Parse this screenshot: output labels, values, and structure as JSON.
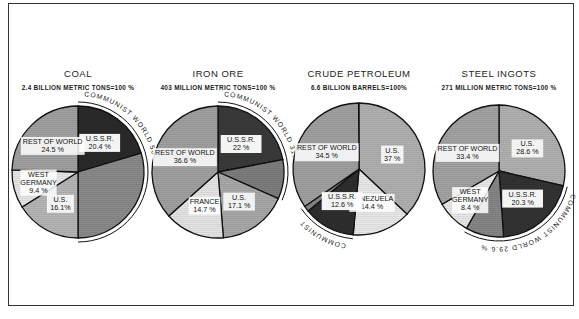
{
  "chart_data": [
    {
      "type": "pie",
      "title": "COAL",
      "subtitle": "2.4 BILLION METRIC TONS=100 %",
      "slices": [
        {
          "label": "U.S.S.R.",
          "value": 20.4,
          "shade": "#2a2a2a",
          "text": "U.S.S.R.|20.4 %"
        },
        {
          "label": "Other Communist",
          "value": 29.6,
          "shade": "#8a8a8a",
          "text": ""
        },
        {
          "label": "U.S.",
          "value": 16.1,
          "shade": "#b5b5b5",
          "text": "U.S.|16.1%"
        },
        {
          "label": "West Germany",
          "value": 9.4,
          "shade": "#e6e6e6",
          "text": "WEST|GERMANY|9.4 %"
        },
        {
          "label": "Rest of World",
          "value": 24.5,
          "shade": "#a0a0a0",
          "text": "REST OF WORLD|24.5 %"
        }
      ],
      "annotation": {
        "text": "COMMUNIST WORLD",
        "value": "50 %"
      }
    },
    {
      "type": "pie",
      "title": "IRON ORE",
      "subtitle": "403 MILLION METRIC TONS=100 %",
      "slices": [
        {
          "label": "U.S.S.R.",
          "value": 22,
          "shade": "#3a3a3a",
          "text": "U.S.S.R.|22 %"
        },
        {
          "label": "Other Communist",
          "value": 9.6,
          "shade": "#7d7d7d",
          "text": ""
        },
        {
          "label": "U.S.",
          "value": 17.1,
          "shade": "#a8a8a8",
          "text": "U.S.|17.1 %"
        },
        {
          "label": "France",
          "value": 14.7,
          "shade": "#e4e4e4",
          "text": "FRANCE|14.7 %"
        },
        {
          "label": "Rest of World",
          "value": 36.6,
          "shade": "#a0a0a0",
          "text": "REST OF WORLD|36.6 %"
        }
      ],
      "annotation": {
        "text": "COMMUNIST WORLD",
        "value": "31.6 %"
      }
    },
    {
      "type": "pie",
      "title": "CRUDE PETROLEUM",
      "subtitle": "6.6 BILLION BARRELS=100%",
      "slices": [
        {
          "label": "U.S.",
          "value": 37,
          "shade": "#b0b0b0",
          "text": "U.S.|37 %"
        },
        {
          "label": "Venezuela",
          "value": 14.4,
          "shade": "#e8e8e8",
          "text": "VENEZUELA|14.4 %"
        },
        {
          "label": "U.S.S.R.",
          "value": 12.6,
          "shade": "#2e2e2e",
          "text": "U.S.S.R.|12.6 %"
        },
        {
          "label": "Other Communist",
          "value": 1.4,
          "shade": "#858585",
          "text": ""
        },
        {
          "label": "Rest of World",
          "value": 34.5,
          "shade": "#a0a0a0",
          "text": "REST OF WORLD|34.5 %"
        }
      ],
      "annotation": {
        "text": "COMMUNIST WORLD",
        "value": "14 %"
      }
    },
    {
      "type": "pie",
      "title": "STEEL INGOTS",
      "subtitle": "271 MILLION METRIC TONS=100 %",
      "slices": [
        {
          "label": "U.S.",
          "value": 28.6,
          "shade": "#b0b0b0",
          "text": "U.S.|28.6 %"
        },
        {
          "label": "U.S.S.R.",
          "value": 20.3,
          "shade": "#333333",
          "text": "U.S.S.R.|20.3 %"
        },
        {
          "label": "Other Communist",
          "value": 9.3,
          "shade": "#858585",
          "text": ""
        },
        {
          "label": "West Germany",
          "value": 8.4,
          "shade": "#e8e8e8",
          "text": "WEST|GERMANY|8.4 %"
        },
        {
          "label": "Rest of World",
          "value": 33.4,
          "shade": "#a3a3a3",
          "text": "REST OF WORLD|33.4 %"
        }
      ],
      "annotation": {
        "text": "COMMUNIST WORLD",
        "value": "29.6 %"
      }
    }
  ],
  "layout": {
    "centers": [
      [
        78,
        172
      ],
      [
        218,
        172
      ],
      [
        359,
        169
      ],
      [
        499,
        171
      ]
    ],
    "radius": 66,
    "start_angles_deg": [
      0,
      0,
      0,
      0
    ]
  }
}
